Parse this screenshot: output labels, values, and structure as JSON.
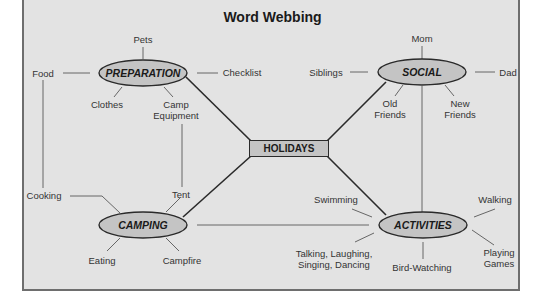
{
  "title": "Word Webbing",
  "center": {
    "label": "HOLIDAYS"
  },
  "nodes": {
    "preparation": {
      "label": "PREPARATION",
      "details": {
        "top": "Pets",
        "left": "Food",
        "right": "Checklist",
        "bottom_left": "Clothes",
        "bottom_right": "Camp Equipment"
      }
    },
    "social": {
      "label": "SOCIAL",
      "details": {
        "top": "Mom",
        "left": "Siblings",
        "right": "Dad",
        "bottom_left": "Old Friends",
        "bottom_right": "New Friends"
      }
    },
    "camping": {
      "label": "CAMPING",
      "details": {
        "top_left": "Cooking",
        "top_right": "Tent",
        "bottom_left": "Eating",
        "bottom_right": "Campfire"
      }
    },
    "activities": {
      "label": "ACTIVITIES",
      "details": {
        "top_left": "Swimming",
        "bottom_left": "Talking, Laughing, Singing, Dancing",
        "bottom": "Bird-Watching",
        "top_right": "Walking",
        "bottom_right": "Playing Games"
      }
    }
  },
  "colors": {
    "background": "#e3e3e3",
    "ellipse_fill": "#c4c4c4",
    "stroke": "#2a2a2a",
    "thin_line": "#555555"
  }
}
